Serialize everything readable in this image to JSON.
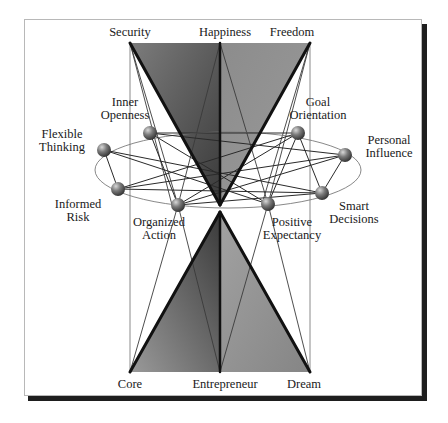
{
  "diagram": {
    "top_labels": [
      "Security",
      "Happiness",
      "Freedom"
    ],
    "bottom_labels": [
      "Core",
      "Entrepreneur",
      "Dream"
    ],
    "nodes": [
      {
        "id": "flexible-thinking",
        "label": "Flexible\nThinking"
      },
      {
        "id": "inner-openness",
        "label": "Inner\nOpenness"
      },
      {
        "id": "goal-orientation",
        "label": "Goal\nOrientation"
      },
      {
        "id": "personal-influence",
        "label": "Personal\nInfluence"
      },
      {
        "id": "informed-risk",
        "label": "Informed\nRisk"
      },
      {
        "id": "organized-action",
        "label": "Organized\nAction"
      },
      {
        "id": "positive-expectancy",
        "label": "Positive\nExpectancy"
      },
      {
        "id": "smart-decisions",
        "label": "Smart\nDecisions"
      }
    ],
    "colors": {
      "triangle_dark": "#4a4a4a",
      "triangle_light": "#8a8a8a",
      "sphere": "#6a6a6a",
      "frame_shadow": "#1e1e1e"
    }
  }
}
